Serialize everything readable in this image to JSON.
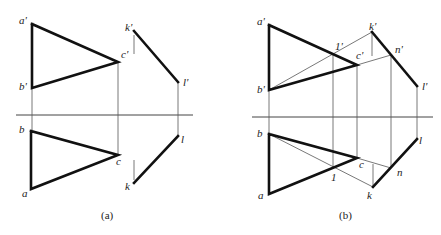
{
  "panels": [
    {
      "id": "a",
      "caption": "(a)",
      "caption_pos": [
        101,
        219
      ],
      "axis": {
        "x1": 16,
        "x2": 193,
        "y": 115
      },
      "points": {
        "a'": [
          32,
          24
        ],
        "b'": [
          32,
          88
        ],
        "c'": [
          118,
          62
        ],
        "k'": [
          134,
          31
        ],
        "l'": [
          178,
          82
        ],
        "a": [
          31,
          189
        ],
        "b": [
          31,
          131
        ],
        "c": [
          118,
          155
        ],
        "k": [
          134,
          183
        ],
        "l": [
          178,
          136
        ]
      },
      "labels": [
        {
          "text": "a'",
          "x": 19,
          "y": 24
        },
        {
          "text": "b'",
          "x": 19,
          "y": 90
        },
        {
          "text": "c'",
          "x": 121,
          "y": 58
        },
        {
          "text": "k'",
          "x": 125,
          "y": 31
        },
        {
          "text": "l'",
          "x": 183,
          "y": 86
        },
        {
          "text": "b",
          "x": 19,
          "y": 133
        },
        {
          "text": "c",
          "x": 116,
          "y": 165
        },
        {
          "text": "a",
          "x": 22,
          "y": 197
        },
        {
          "text": "k",
          "x": 125,
          "y": 190
        },
        {
          "text": "l",
          "x": 181,
          "y": 143
        }
      ],
      "thick_polylines": [
        [
          [
            32,
            24
          ],
          [
            118,
            62
          ],
          [
            32,
            88
          ],
          [
            32,
            24
          ]
        ],
        [
          [
            134,
            31
          ],
          [
            178,
            82
          ]
        ],
        [
          [
            31,
            131
          ],
          [
            118,
            155
          ],
          [
            31,
            189
          ],
          [
            31,
            131
          ]
        ],
        [
          [
            178,
            136
          ],
          [
            134,
            183
          ]
        ]
      ],
      "thin_lines": [
        [
          [
            32,
            88
          ],
          [
            32,
            131
          ]
        ],
        [
          [
            118,
            62
          ],
          [
            118,
            155
          ]
        ],
        [
          [
            178,
            82
          ],
          [
            178,
            136
          ]
        ],
        [
          [
            134,
            35
          ],
          [
            134,
            54
          ]
        ],
        [
          [
            134,
            160
          ],
          [
            134,
            180
          ]
        ]
      ]
    },
    {
      "id": "b",
      "caption": "(b)",
      "caption_pos": [
        339,
        219
      ],
      "axis": {
        "x1": 252,
        "x2": 433,
        "y": 117
      },
      "points": {
        "a'": [
          269,
          25
        ],
        "b'": [
          269,
          90
        ],
        "c'": [
          357,
          65
        ],
        "k'": [
          372,
          32
        ],
        "l'": [
          417,
          86
        ],
        "n'": [
          391,
          55
        ],
        "1'": [
          333,
          54
        ],
        "a": [
          269,
          194
        ],
        "b": [
          269,
          134
        ],
        "c": [
          357,
          158
        ],
        "k": [
          373,
          187
        ],
        "l": [
          417,
          139
        ],
        "n": [
          391,
          168
        ],
        "1": [
          333,
          168
        ]
      },
      "labels": [
        {
          "text": "a'",
          "x": 257,
          "y": 25
        },
        {
          "text": "b'",
          "x": 257,
          "y": 93
        },
        {
          "text": "c'",
          "x": 356,
          "y": 59
        },
        {
          "text": "k'",
          "x": 369,
          "y": 30
        },
        {
          "text": "n'",
          "x": 395,
          "y": 53
        },
        {
          "text": "1'",
          "x": 335,
          "y": 50
        },
        {
          "text": "l'",
          "x": 422,
          "y": 90
        },
        {
          "text": "b",
          "x": 257,
          "y": 137
        },
        {
          "text": "c",
          "x": 359,
          "y": 168
        },
        {
          "text": "a",
          "x": 258,
          "y": 199
        },
        {
          "text": "k",
          "x": 367,
          "y": 199
        },
        {
          "text": "n",
          "x": 397,
          "y": 176
        },
        {
          "text": "1",
          "x": 331,
          "y": 181
        },
        {
          "text": "l",
          "x": 419,
          "y": 144
        }
      ],
      "thick_polylines": [
        [
          [
            269,
            25
          ],
          [
            357,
            65
          ],
          [
            269,
            90
          ],
          [
            269,
            25
          ]
        ],
        [
          [
            372,
            32
          ],
          [
            417,
            86
          ]
        ],
        [
          [
            269,
            134
          ],
          [
            357,
            158
          ],
          [
            269,
            194
          ],
          [
            269,
            134
          ]
        ],
        [
          [
            417,
            139
          ],
          [
            373,
            187
          ]
        ]
      ],
      "thin_lines": [
        [
          [
            269,
            90
          ],
          [
            269,
            134
          ]
        ],
        [
          [
            357,
            65
          ],
          [
            357,
            158
          ]
        ],
        [
          [
            417,
            86
          ],
          [
            417,
            139
          ]
        ],
        [
          [
            391,
            55
          ],
          [
            391,
            168
          ]
        ],
        [
          [
            333,
            54
          ],
          [
            333,
            168
          ]
        ],
        [
          [
            372,
            32
          ],
          [
            372,
            56
          ]
        ],
        [
          [
            373,
            164
          ],
          [
            373,
            187
          ]
        ],
        [
          [
            269,
            90
          ],
          [
            372,
            32
          ]
        ],
        [
          [
            357,
            65
          ],
          [
            391,
            55
          ]
        ],
        [
          [
            269,
            134
          ],
          [
            373,
            187
          ]
        ],
        [
          [
            357,
            158
          ],
          [
            391,
            168
          ]
        ]
      ]
    }
  ]
}
